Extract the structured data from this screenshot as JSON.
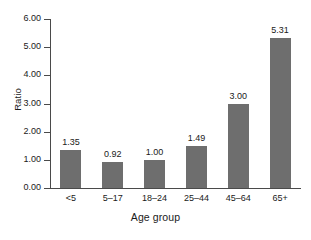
{
  "chart_data": {
    "type": "bar",
    "title": "",
    "subtitle": "",
    "xlabel": "Age group",
    "ylabel": "Ratio",
    "categories": [
      "<5",
      "5–17",
      "18–24",
      "25–44",
      "45–64",
      "65+"
    ],
    "values": [
      1.35,
      0.92,
      1.0,
      1.49,
      3.0,
      5.31
    ],
    "value_labels": [
      "1.35",
      "0.92",
      "1.00",
      "1.49",
      "3.00",
      "5.31"
    ],
    "ylim": [
      0.0,
      6.0
    ],
    "ytick_values": [
      0.0,
      1.0,
      2.0,
      3.0,
      4.0,
      5.0,
      6.0
    ],
    "ytick_labels": [
      "0.00",
      "1.00",
      "2.00",
      "3.00",
      "4.00",
      "5.00",
      "6.00"
    ],
    "grid": false,
    "legend": false,
    "legend_position": "none",
    "bar_color": "#6e6e6e",
    "axis_color": "#4a4a4a",
    "background_color": "#ffffff",
    "text_color": "#1a1a1a"
  }
}
